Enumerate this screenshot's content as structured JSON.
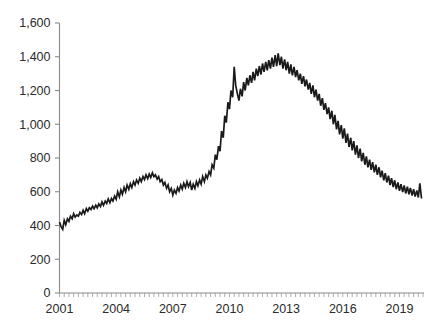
{
  "chart_data": {
    "type": "line",
    "title": "",
    "subtitle": "",
    "xlabel": "",
    "ylabel": "",
    "xlim": [
      2001.0,
      2020.3
    ],
    "ylim": [
      0,
      1600
    ],
    "grid": false,
    "legend": null,
    "legend_position": "none",
    "y_ticks": [
      0,
      200,
      400,
      600,
      800,
      1000,
      1200,
      1400,
      1600
    ],
    "y_tick_labels": [
      "0",
      "200",
      "400",
      "600",
      "800",
      "1,000",
      "1,200",
      "1,400",
      "1,600"
    ],
    "x_ticks": [
      2001,
      2004,
      2007,
      2010,
      2013,
      2016,
      2019
    ],
    "x_tick_labels": [
      "2001",
      "2004",
      "2007",
      "2010",
      "2013",
      "2016",
      "2019"
    ],
    "x_minor_tick_interval": 0.25,
    "series": [
      {
        "name": "series-1",
        "color": "#1a1a1a",
        "x": [
          2001.0,
          2001.08,
          2001.17,
          2001.25,
          2001.33,
          2001.42,
          2001.5,
          2001.58,
          2001.67,
          2001.75,
          2001.83,
          2001.92,
          2002.0,
          2002.08,
          2002.17,
          2002.25,
          2002.33,
          2002.42,
          2002.5,
          2002.58,
          2002.67,
          2002.75,
          2002.83,
          2002.92,
          2003.0,
          2003.08,
          2003.17,
          2003.25,
          2003.33,
          2003.42,
          2003.5,
          2003.58,
          2003.67,
          2003.75,
          2003.83,
          2003.92,
          2004.0,
          2004.08,
          2004.17,
          2004.25,
          2004.33,
          2004.42,
          2004.5,
          2004.58,
          2004.67,
          2004.75,
          2004.83,
          2004.92,
          2005.0,
          2005.08,
          2005.17,
          2005.25,
          2005.33,
          2005.42,
          2005.5,
          2005.58,
          2005.67,
          2005.75,
          2005.83,
          2005.92,
          2006.0,
          2006.08,
          2006.17,
          2006.25,
          2006.33,
          2006.42,
          2006.5,
          2006.58,
          2006.67,
          2006.75,
          2006.83,
          2006.92,
          2007.0,
          2007.08,
          2007.17,
          2007.25,
          2007.33,
          2007.42,
          2007.5,
          2007.58,
          2007.67,
          2007.75,
          2007.83,
          2007.92,
          2008.0,
          2008.08,
          2008.17,
          2008.25,
          2008.33,
          2008.42,
          2008.5,
          2008.58,
          2008.67,
          2008.75,
          2008.83,
          2008.92,
          2009.0,
          2009.08,
          2009.17,
          2009.25,
          2009.33,
          2009.42,
          2009.5,
          2009.58,
          2009.67,
          2009.75,
          2009.83,
          2009.92,
          2010.0,
          2010.08,
          2010.17,
          2010.25,
          2010.33,
          2010.42,
          2010.5,
          2010.58,
          2010.67,
          2010.75,
          2010.83,
          2010.92,
          2011.0,
          2011.08,
          2011.17,
          2011.25,
          2011.33,
          2011.42,
          2011.5,
          2011.58,
          2011.67,
          2011.75,
          2011.83,
          2011.92,
          2012.0,
          2012.08,
          2012.17,
          2012.25,
          2012.33,
          2012.42,
          2012.5,
          2012.58,
          2012.67,
          2012.75,
          2012.83,
          2012.92,
          2013.0,
          2013.08,
          2013.17,
          2013.25,
          2013.33,
          2013.42,
          2013.5,
          2013.58,
          2013.67,
          2013.75,
          2013.83,
          2013.92,
          2014.0,
          2014.08,
          2014.17,
          2014.25,
          2014.33,
          2014.42,
          2014.5,
          2014.58,
          2014.67,
          2014.75,
          2014.83,
          2014.92,
          2015.0,
          2015.08,
          2015.17,
          2015.25,
          2015.33,
          2015.42,
          2015.5,
          2015.58,
          2015.67,
          2015.75,
          2015.83,
          2015.92,
          2016.0,
          2016.08,
          2016.17,
          2016.25,
          2016.33,
          2016.42,
          2016.5,
          2016.58,
          2016.67,
          2016.75,
          2016.83,
          2016.92,
          2017.0,
          2017.08,
          2017.17,
          2017.25,
          2017.33,
          2017.42,
          2017.5,
          2017.58,
          2017.67,
          2017.75,
          2017.83,
          2017.92,
          2018.0,
          2018.08,
          2018.17,
          2018.25,
          2018.33,
          2018.42,
          2018.5,
          2018.58,
          2018.67,
          2018.75,
          2018.83,
          2018.92,
          2019.0,
          2019.08,
          2019.17,
          2019.25,
          2019.33,
          2019.42,
          2019.5,
          2019.58,
          2019.67,
          2019.75,
          2019.83,
          2019.92,
          2020.0,
          2020.08,
          2020.17
        ],
        "y": [
          420,
          395,
          378,
          430,
          405,
          440,
          425,
          455,
          440,
          470,
          450,
          462,
          455,
          478,
          465,
          490,
          470,
          500,
          485,
          505,
          495,
          515,
          500,
          520,
          505,
          528,
          512,
          540,
          520,
          545,
          530,
          558,
          535,
          560,
          545,
          575,
          555,
          600,
          570,
          610,
          585,
          625,
          600,
          640,
          615,
          648,
          625,
          660,
          640,
          670,
          650,
          680,
          660,
          690,
          672,
          700,
          678,
          705,
          685,
          712,
          690,
          700,
          675,
          690,
          660,
          672,
          640,
          655,
          620,
          640,
          600,
          620,
          580,
          610,
          590,
          625,
          605,
          640,
          615,
          650,
          625,
          660,
          630,
          655,
          610,
          645,
          620,
          660,
          635,
          670,
          645,
          690,
          660,
          700,
          680,
          720,
          700,
          760,
          740,
          820,
          790,
          870,
          840,
          960,
          920,
          1050,
          1010,
          1130,
          1090,
          1200,
          1160,
          1340,
          1230,
          1180,
          1140,
          1210,
          1165,
          1250,
          1200,
          1275,
          1230,
          1290,
          1245,
          1310,
          1260,
          1330,
          1285,
          1345,
          1295,
          1360,
          1310,
          1370,
          1320,
          1380,
          1330,
          1395,
          1340,
          1410,
          1345,
          1420,
          1350,
          1400,
          1330,
          1385,
          1320,
          1370,
          1300,
          1355,
          1290,
          1340,
          1280,
          1320,
          1260,
          1300,
          1240,
          1285,
          1225,
          1265,
          1205,
          1245,
          1180,
          1230,
          1160,
          1205,
          1140,
          1180,
          1110,
          1155,
          1085,
          1125,
          1060,
          1100,
          1030,
          1080,
          1000,
          1055,
          970,
          1020,
          940,
          995,
          915,
          975,
          890,
          945,
          865,
          920,
          845,
          900,
          820,
          875,
          800,
          855,
          780,
          830,
          760,
          810,
          745,
          790,
          730,
          775,
          715,
          760,
          700,
          745,
          685,
          725,
          668,
          710,
          655,
          695,
          640,
          680,
          628,
          668,
          615,
          655,
          605,
          645,
          598,
          638,
          590,
          630,
          585,
          622,
          578,
          615,
          572,
          608,
          566,
          650,
          560
        ]
      }
    ]
  },
  "axes": {
    "y_axis_name": "y-axis",
    "x_axis_name": "x-axis"
  }
}
